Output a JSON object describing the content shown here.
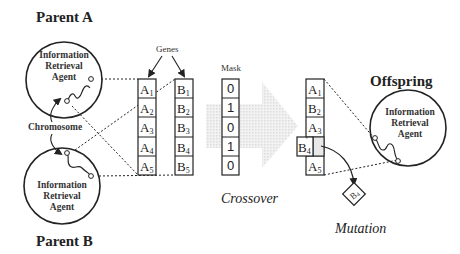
{
  "parent_a": {
    "label": "Parent A",
    "agent_lines": [
      "Information",
      "Retrieval",
      "Agent"
    ]
  },
  "parent_b": {
    "label": "Parent B",
    "agent_lines": [
      "Information",
      "Retrieval",
      "Agent"
    ]
  },
  "offspring": {
    "label": "Offspring",
    "agent_lines": [
      "Information",
      "Retrieval",
      "Agent"
    ]
  },
  "labels": {
    "genes": "Genes",
    "chromosome": "Chromosome",
    "mask": "Mask",
    "crossover": "Crossover",
    "mutation": "Mutation"
  },
  "columns": {
    "a": [
      {
        "main": "A",
        "sub": "1"
      },
      {
        "main": "A",
        "sub": "2"
      },
      {
        "main": "A",
        "sub": "3"
      },
      {
        "main": "A",
        "sub": "4"
      },
      {
        "main": "A",
        "sub": "5"
      }
    ],
    "b": [
      {
        "main": "B",
        "sub": "1"
      },
      {
        "main": "B",
        "sub": "2"
      },
      {
        "main": "B",
        "sub": "3"
      },
      {
        "main": "B",
        "sub": "4"
      },
      {
        "main": "B",
        "sub": "5"
      }
    ],
    "mask": [
      "0",
      "1",
      "0",
      "1",
      "0"
    ],
    "offspring": [
      {
        "main": "A",
        "sub": "1"
      },
      {
        "main": "B",
        "sub": "2"
      },
      {
        "main": "A",
        "sub": "3"
      },
      {
        "main": "B",
        "sub": "4",
        "prime": "'"
      },
      {
        "main": "A",
        "sub": "5"
      }
    ]
  },
  "mutation_gene": {
    "main": "B",
    "sub": "4"
  },
  "colors": {
    "line": "#222222",
    "arrow_fill": "#e6e6e6",
    "mutated_cell": "#e8e8e8"
  }
}
